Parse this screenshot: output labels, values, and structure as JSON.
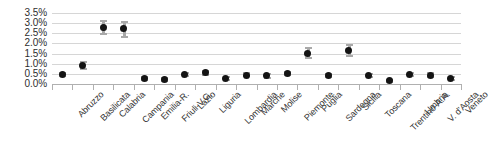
{
  "chart_data": {
    "type": "scatter",
    "title": "",
    "subtitle": "",
    "xlabel": "",
    "ylabel": "",
    "ylim": [
      0,
      3.5
    ],
    "ytick_labels": [
      "3.5%",
      "3.0%",
      "2.5%",
      "2.0%",
      "1.5%",
      "1.0%",
      "0.5%",
      "0.0%"
    ],
    "ytick_values": [
      3.5,
      3.0,
      2.5,
      2.0,
      1.5,
      1.0,
      0.5,
      0.0
    ],
    "grid": true,
    "legend": "none",
    "value_unit": "%",
    "marker_color": "#141414",
    "errorbar_color": "#a9a9a9",
    "gridline_color": "#d6d6d6",
    "axis_color": "#b0b0b0",
    "categories": [
      "Abruzzo",
      "Basilicata",
      "Calabria",
      "Campania",
      "Emilia-R.",
      "Friuli-V.G.",
      "Lazio",
      "Liguria",
      "Lombardia",
      "Marche",
      "Molise",
      "Piemonte",
      "Puglia",
      "Sardegna",
      "Sicilia",
      "Toscana",
      "Trentino-A.A.",
      "Umbria",
      "V. d'Aosta",
      "Veneto"
    ],
    "values": [
      0.47,
      0.9,
      2.8,
      2.72,
      0.27,
      0.22,
      0.47,
      0.55,
      0.27,
      0.44,
      0.4,
      0.52,
      1.52,
      0.4,
      1.65,
      0.42,
      0.15,
      0.45,
      0.44,
      0.27
    ],
    "error_low": [
      0.4,
      0.72,
      2.45,
      2.3,
      0.21,
      0.17,
      0.4,
      0.45,
      0.22,
      0.37,
      0.32,
      0.44,
      1.3,
      0.33,
      1.4,
      0.35,
      0.1,
      0.38,
      0.36,
      0.21
    ],
    "error_high": [
      0.55,
      1.08,
      3.12,
      3.05,
      0.34,
      0.28,
      0.55,
      0.66,
      0.33,
      0.52,
      0.49,
      0.61,
      1.76,
      0.48,
      1.93,
      0.5,
      0.21,
      0.53,
      0.53,
      0.34
    ]
  }
}
